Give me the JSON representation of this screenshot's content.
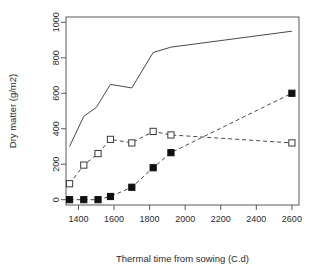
{
  "chart_data": {
    "type": "line",
    "title": "",
    "xlabel": "Thermal time from sowing (C.d)",
    "ylabel": "Dry matter (g/m2)",
    "xlim": [
      1330,
      2640
    ],
    "ylim": [
      -30,
      1030
    ],
    "xticks": [
      1400,
      1600,
      1800,
      2000,
      2200,
      2400,
      2600
    ],
    "yticks": [
      0,
      200,
      400,
      600,
      800,
      1000
    ],
    "xtick_labels": [
      "1400",
      "1600",
      "1800",
      "2000",
      "2200",
      "2400",
      "2600"
    ],
    "ytick_labels": [
      "0",
      "200",
      "400",
      "600",
      "800",
      "1000"
    ],
    "grid": false,
    "legend": "none",
    "series": [
      {
        "name": "total-dry-matter",
        "style": "solid-line-no-marker",
        "marker": "none",
        "line": "solid",
        "x": [
          1350,
          1430,
          1500,
          1580,
          1700,
          1820,
          1920,
          2600
        ],
        "values": [
          300,
          470,
          520,
          650,
          630,
          830,
          860,
          950
        ]
      },
      {
        "name": "open-square-series",
        "style": "dashed-line-open-square",
        "marker": "open-square",
        "line": "dashed",
        "x": [
          1350,
          1430,
          1510,
          1580,
          1700,
          1820,
          1920,
          2600
        ],
        "values": [
          90,
          195,
          260,
          340,
          320,
          385,
          365,
          320
        ]
      },
      {
        "name": "filled-square-series",
        "style": "dashed-line-filled-square",
        "marker": "filled-square",
        "line": "dashed",
        "x": [
          1350,
          1430,
          1510,
          1580,
          1700,
          1820,
          1920,
          2600
        ],
        "values": [
          0,
          0,
          0,
          18,
          70,
          180,
          265,
          600
        ]
      }
    ],
    "colors": {
      "line": "#4a4a4a",
      "marker_fill": "#111111",
      "marker_open_fill": "#ffffff",
      "axis": "#5a5a5a",
      "text": "#2b2b2b",
      "background": "#ffffff"
    }
  }
}
